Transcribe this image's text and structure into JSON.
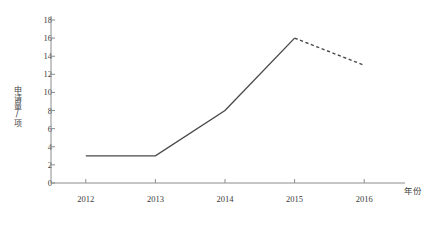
{
  "chart_data": {
    "type": "line",
    "title": "",
    "subtitle": "",
    "xlabel": "年份",
    "ylabel": "申请量/项",
    "x": [
      "2012",
      "2013",
      "2014",
      "2015",
      "2016"
    ],
    "categories": [
      "2012",
      "2013",
      "2014",
      "2015",
      "2016"
    ],
    "values": [
      3,
      3,
      8,
      16,
      13
    ],
    "series": [
      {
        "name": "实际",
        "style": "solid",
        "color": "#4a4a4a",
        "x": [
          "2012",
          "2013",
          "2014",
          "2015"
        ],
        "values": [
          3,
          3,
          8,
          16
        ]
      },
      {
        "name": "预测",
        "style": "dashed",
        "color": "#4a4a4a",
        "x": [
          "2015",
          "2016"
        ],
        "values": [
          16,
          13
        ]
      }
    ],
    "ylim": [
      0,
      18
    ],
    "ytick_step": 2,
    "yticks": [
      0,
      2,
      4,
      6,
      8,
      10,
      12,
      14,
      16,
      18
    ],
    "ytick_labels": [
      "0",
      "2",
      "4",
      "6",
      "8",
      "10",
      "12",
      "14",
      "16",
      "18"
    ],
    "xtick_labels": [
      "2012",
      "2013",
      "2014",
      "2015",
      "2016"
    ],
    "grid": false,
    "legend": false,
    "legend_position": "none",
    "annotations": []
  },
  "axes": {
    "y_title": "申请量/项",
    "x_title": "年份"
  },
  "caption": {
    "text": ""
  },
  "colors": {
    "line": "#4a4a4a",
    "axis": "#8c8c8c",
    "text": "#3a3a3a",
    "background": "#ffffff"
  }
}
